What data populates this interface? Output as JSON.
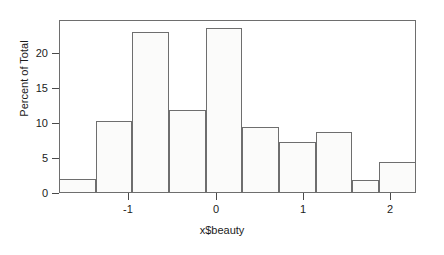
{
  "chart_data": {
    "type": "bar",
    "title": "",
    "subtitle": "",
    "xlabel": "x$beauty",
    "ylabel": "Percent of Total",
    "grid": false,
    "legend": false,
    "legend_position": "none",
    "xlim": [
      -1.65,
      2.1
    ],
    "ylim": [
      0,
      24
    ],
    "xticks": [
      "-1",
      "0",
      "1",
      "2"
    ],
    "xtick_values": [
      -1,
      0,
      1,
      2
    ],
    "yticks": [
      "0",
      "5",
      "10",
      "15",
      "20"
    ],
    "ytick_values": [
      0,
      5,
      10,
      15,
      20
    ],
    "bin_width": 0.385,
    "bin_edges": [
      -1.65,
      -1.265,
      -0.88,
      -0.495,
      -0.11,
      0.275,
      0.66,
      1.045,
      1.43,
      1.715,
      2.1
    ],
    "categories": [
      "-1.65 to -1.27",
      "-1.27 to -0.88",
      "-0.88 to -0.50",
      "-0.50 to -0.11",
      "-0.11 to 0.28",
      "0.28 to 0.66",
      "0.66 to 1.05",
      "1.05 to 1.43",
      "1.43 to 1.72",
      "1.72 to 2.10"
    ],
    "values": [
      1.9,
      10.0,
      22.4,
      11.5,
      22.9,
      9.2,
      7.1,
      8.4,
      1.8,
      4.3
    ],
    "bar_fill_color": "#fbfbfa",
    "bar_edge_color": "#6e6e6e",
    "axis_color": "#4a4a4a",
    "background_color": "#ffffff"
  },
  "axes": {
    "y_title": "Percent of Total",
    "x_title": "x$beauty"
  }
}
